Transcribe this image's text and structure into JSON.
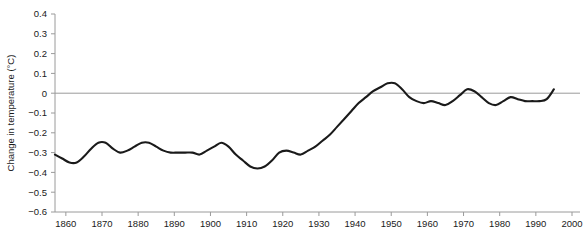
{
  "chart_data": {
    "type": "line",
    "title": "",
    "subtitle": "",
    "xlabel": "",
    "ylabel": "Change in temperature (°C)",
    "xlim": [
      1857,
      2000
    ],
    "ylim": [
      -0.6,
      0.4
    ],
    "grid": false,
    "legend": null,
    "zero_reference_line": 0,
    "x_ticks": [
      1860,
      1870,
      1880,
      1890,
      1900,
      1910,
      1920,
      1930,
      1940,
      1950,
      1960,
      1970,
      1980,
      1990,
      2000
    ],
    "x_tick_labels": [
      "1860",
      "1870",
      "1880",
      "1890",
      "1900",
      "1910",
      "1920",
      "1930",
      "1940",
      "1950",
      "1960",
      "1970",
      "1980",
      "1990",
      "2000"
    ],
    "y_ticks": [
      0.4,
      0.3,
      0.2,
      0.1,
      0,
      -0.1,
      -0.2,
      -0.3,
      -0.4,
      -0.5,
      -0.6
    ],
    "y_tick_labels": [
      "0.4",
      "0.3",
      "0.2",
      "0.1",
      "0",
      "−0.1",
      "−0.2",
      "−0.3",
      "−0.4",
      "−0.5",
      "−0.6"
    ],
    "line_color": "#1a1a1a",
    "axis_color": "#9a9a9a",
    "series": [
      {
        "name": "Global temperature anomaly",
        "x": [
          1857,
          1859,
          1861,
          1863,
          1865,
          1867,
          1869,
          1871,
          1873,
          1875,
          1877,
          1879,
          1881,
          1883,
          1885,
          1887,
          1889,
          1891,
          1893,
          1895,
          1897,
          1899,
          1901,
          1903,
          1905,
          1907,
          1909,
          1911,
          1913,
          1915,
          1917,
          1919,
          1921,
          1923,
          1925,
          1927,
          1929,
          1931,
          1933,
          1935,
          1937,
          1939,
          1941,
          1943,
          1945,
          1947,
          1949,
          1951,
          1953,
          1955,
          1957,
          1959,
          1961,
          1963,
          1965,
          1967,
          1969,
          1971,
          1973,
          1975,
          1977,
          1979,
          1981,
          1983,
          1985,
          1987,
          1989,
          1991,
          1993,
          1995
        ],
        "y": [
          -0.31,
          -0.33,
          -0.35,
          -0.35,
          -0.32,
          -0.28,
          -0.25,
          -0.25,
          -0.28,
          -0.3,
          -0.29,
          -0.27,
          -0.25,
          -0.25,
          -0.27,
          -0.29,
          -0.3,
          -0.3,
          -0.3,
          -0.3,
          -0.31,
          -0.29,
          -0.27,
          -0.25,
          -0.27,
          -0.31,
          -0.34,
          -0.37,
          -0.38,
          -0.37,
          -0.34,
          -0.3,
          -0.29,
          -0.3,
          -0.31,
          -0.29,
          -0.27,
          -0.24,
          -0.21,
          -0.17,
          -0.13,
          -0.09,
          -0.05,
          -0.02,
          0.01,
          0.03,
          0.05,
          0.05,
          0.02,
          -0.02,
          -0.04,
          -0.05,
          -0.04,
          -0.05,
          -0.06,
          -0.04,
          -0.01,
          0.02,
          0.01,
          -0.02,
          -0.05,
          -0.06,
          -0.04,
          -0.02,
          -0.03,
          -0.04,
          -0.04,
          -0.04,
          -0.03,
          0.02
        ]
      }
    ],
    "annotations": []
  }
}
